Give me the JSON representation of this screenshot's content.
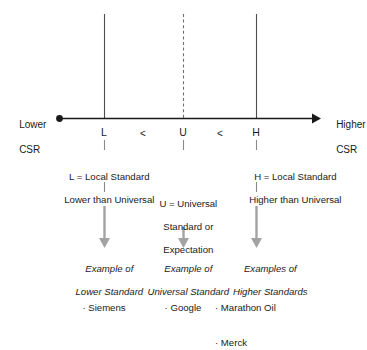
{
  "axis": {
    "left_label": "Lower\nCSR",
    "left_label_line1": "Lower",
    "left_label_line2": "CSR",
    "right_label_line1": "Higher",
    "right_label_line2": "CSR",
    "endpoint_marker": "filled-dot",
    "arrow_marker": "arrowhead-right",
    "color": "#1a1a1a"
  },
  "scale": {
    "markers": [
      {
        "letter": "L",
        "type": "solid-gridline"
      },
      {
        "letter": "U",
        "type": "dashed-gridline"
      },
      {
        "letter": "H",
        "type": "solid-gridline"
      }
    ],
    "comparators": [
      "<",
      "<"
    ]
  },
  "definitions": {
    "low": {
      "line1": "L = Local Standard",
      "line2": "Lower than Universal"
    },
    "universal": {
      "line1": "U = Universal",
      "line2": "Standard or",
      "line3": "Expectation"
    },
    "high": {
      "line1": "H = Local Standard",
      "line2": "Higher than Universal"
    }
  },
  "examples": {
    "low": {
      "title_line1": "Example of",
      "title_line2": "Lower Standard",
      "items": [
        "· Siemens"
      ]
    },
    "universal": {
      "title_line1": "Example of",
      "title_line2": "Universal Standard",
      "items": [
        "· Google"
      ]
    },
    "high": {
      "title_line1": "Examples of",
      "title_line2": "Higher Standards",
      "items": [
        "· Marathon Oil",
        "· Merck"
      ]
    }
  },
  "colors": {
    "line": "#1a1a1a",
    "gridline": "#4d4d4d",
    "dashed_gridline": "#6e6e6e",
    "arrow": "#9a9a9a",
    "text": "#1a1a1a",
    "background": "#ffffff"
  }
}
